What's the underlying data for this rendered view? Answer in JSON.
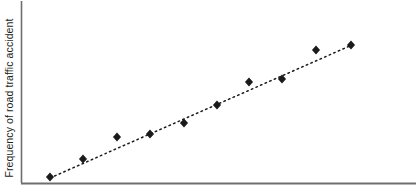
{
  "chart_data": {
    "type": "scatter",
    "title": "",
    "xlabel": "",
    "ylabel": "Frequency of road traffic accident",
    "grid": false,
    "legend": null,
    "axes": {
      "x_axis_visible": true,
      "y_axis_visible": true,
      "x_ticks": [],
      "y_ticks": [],
      "x_tick_labels": [],
      "y_tick_labels": [],
      "xlim": [
        0,
        100
      ],
      "ylim": [
        0,
        100
      ],
      "frame": {
        "left_px": 21,
        "bottom_px": 183,
        "top_px": 1,
        "right_px": 416
      }
    },
    "marker": {
      "shape": "diamond",
      "color": "#1a1a1a",
      "size_px": 7
    },
    "trendline": {
      "style": "dotted",
      "color": "#1a1a1a",
      "width_px": 1.4,
      "x_start_px": 50,
      "y_start_px": 178,
      "x_end_px": 352,
      "y_end_px": 45,
      "description": "dotted linear fit rising left to right"
    },
    "points_px": [
      {
        "x": 50,
        "y": 177
      },
      {
        "x": 83,
        "y": 159
      },
      {
        "x": 117,
        "y": 137
      },
      {
        "x": 150,
        "y": 134
      },
      {
        "x": 184,
        "y": 123
      },
      {
        "x": 217,
        "y": 105
      },
      {
        "x": 249,
        "y": 82
      },
      {
        "x": 282,
        "y": 79
      },
      {
        "x": 316,
        "y": 50
      },
      {
        "x": 351,
        "y": 45
      }
    ],
    "x": [
      9.6,
      20.5,
      31.9,
      43.0,
      54.4,
      65.5,
      76.2,
      87.3,
      98.6,
      110.4
    ],
    "values": [
      3.3,
      13.2,
      25.4,
      27.0,
      33.1,
      43.0,
      55.7,
      57.3,
      73.3,
      76.0
    ],
    "series": [
      {
        "name": "observations",
        "values": [
          3.3,
          13.2,
          25.4,
          27.0,
          33.1,
          43.0,
          55.7,
          57.3,
          73.3,
          76.0
        ]
      }
    ],
    "annotations": [],
    "colors": {
      "marker": "#1a1a1a",
      "trendline": "#1a1a1a",
      "axis": "#6d6e71",
      "background": "#ffffff",
      "label_text": "#231f20"
    }
  },
  "figure": {
    "y_axis_title": "Frequency of road traffic accident",
    "x_axis_title": ""
  }
}
